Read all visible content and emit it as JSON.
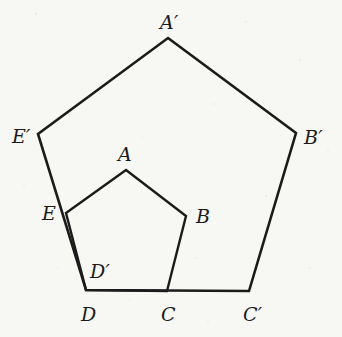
{
  "figure": {
    "background_color": "#f7f7f4",
    "stroke_color": "#1b1b1b",
    "label_color": "#1b1b1b",
    "stroke_width_outer": 2.6,
    "stroke_width_inner": 2.4,
    "width": 342,
    "height": 337
  },
  "chart_data": {
    "type": "diagram",
    "subtype": "geometry-polygon-dilation",
    "xlabel": "",
    "ylabel": "",
    "xlim": [
      0,
      342
    ],
    "ylim": [
      337,
      0
    ],
    "grid": false,
    "legend": "none",
    "shapes": [
      {
        "name": "outer-pentagon",
        "label": "A'B'C'D'E'",
        "closed": true,
        "vertices": [
          {
            "label": "A'",
            "x": 168,
            "y": 38
          },
          {
            "label": "B'",
            "x": 296,
            "y": 133
          },
          {
            "label": "C'",
            "x": 249,
            "y": 291
          },
          {
            "label": "D'",
            "x": 86,
            "y": 290
          },
          {
            "label": "E'",
            "x": 38,
            "y": 134
          }
        ]
      },
      {
        "name": "inner-pentagon",
        "label": "ABCDE",
        "closed": true,
        "vertices": [
          {
            "label": "A",
            "x": 126,
            "y": 170
          },
          {
            "label": "B",
            "x": 186,
            "y": 216
          },
          {
            "label": "C",
            "x": 167,
            "y": 291
          },
          {
            "label": "D",
            "x": 86,
            "y": 290
          },
          {
            "label": "E",
            "x": 66,
            "y": 213
          }
        ]
      }
    ],
    "annotations": [
      {
        "text": "A'",
        "x": 168,
        "y": 22,
        "anchor": "middle"
      },
      {
        "text": "B'",
        "x": 313,
        "y": 139,
        "anchor": "start"
      },
      {
        "text": "C'",
        "x": 251,
        "y": 316,
        "anchor": "middle"
      },
      {
        "text": "D",
        "x": 88,
        "y": 316,
        "anchor": "middle"
      },
      {
        "text": "D'",
        "x": 99,
        "y": 276,
        "anchor": "middle"
      },
      {
        "text": "E'",
        "x": 21,
        "y": 139,
        "anchor": "middle"
      },
      {
        "text": "A",
        "x": 124,
        "y": 156,
        "anchor": "middle"
      },
      {
        "text": "B",
        "x": 200,
        "y": 219,
        "anchor": "start"
      },
      {
        "text": "C",
        "x": 167,
        "y": 316,
        "anchor": "middle"
      },
      {
        "text": "E",
        "x": 49,
        "y": 216,
        "anchor": "middle"
      }
    ]
  },
  "labels": {
    "A_prime": "A′",
    "B_prime": "B′",
    "C_prime": "C′",
    "D_prime": "D′",
    "E_prime": "E′",
    "A": "A",
    "B": "B",
    "C": "C",
    "D": "D",
    "E": "E"
  }
}
